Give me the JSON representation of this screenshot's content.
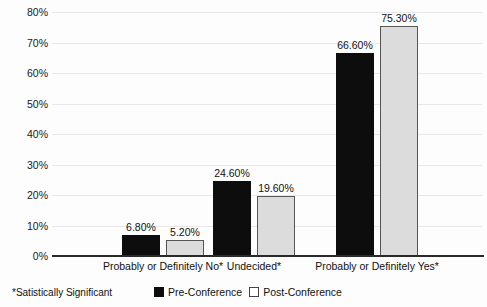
{
  "chart_data": {
    "type": "bar",
    "title": "",
    "subtitle": "",
    "xlabel": "",
    "ylabel": "",
    "ylim": [
      0,
      80
    ],
    "ytick_labels": [
      "0%",
      "10%",
      "20%",
      "30%",
      "40%",
      "50%",
      "60%",
      "70%",
      "80%"
    ],
    "ytick_values": [
      0,
      10,
      20,
      30,
      40,
      50,
      60,
      70,
      80
    ],
    "grid": true,
    "grid_axis": "y",
    "legend_position": "bottom-center",
    "categories": [
      "Probably or Definitely No*",
      "Undecided*",
      "Probably or Definitely Yes*"
    ],
    "series": [
      {
        "name": "Pre-Conference",
        "color": "#0d0d0d",
        "values": [
          6.8,
          24.6,
          66.6
        ],
        "labels": [
          "6.80%",
          "24.60%",
          "75.30%"
        ]
      },
      {
        "name": "Post-Conference",
        "color": "#dcdcdc",
        "values": [
          5.2,
          19.6,
          75.3
        ],
        "labels": [
          "5.20%",
          "19.60%",
          "75.30%"
        ]
      }
    ],
    "data_labels": [
      [
        "6.80%",
        "5.20%"
      ],
      [
        "24.60%",
        "19.60%"
      ],
      [
        "66.60%",
        "75.30%"
      ]
    ],
    "annotations": [
      "*Satistically Significant"
    ]
  },
  "legend": {
    "items": [
      {
        "label": "Pre-Conference",
        "swatch": "pre"
      },
      {
        "label": "Post-Conference",
        "swatch": "post"
      }
    ]
  },
  "footnote": {
    "text": "*Satistically Significant"
  },
  "colors": {
    "pre_conference": "#0d0d0d",
    "post_conference": "#dcdcdc",
    "post_conference_border": "#555555",
    "axis": "#2a2a2a",
    "gridline": "#e8e8e8",
    "background": "#fdfdfd"
  }
}
